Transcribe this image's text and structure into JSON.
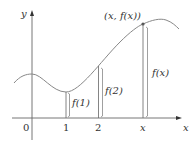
{
  "axes": {
    "x_label": "x",
    "y_label": "y",
    "origin_label": "0",
    "ticks": [
      "1",
      "2",
      "x"
    ]
  },
  "point": {
    "label": "(x, f(x))"
  },
  "heights": [
    {
      "label": "f(1)"
    },
    {
      "label": "f(2)"
    },
    {
      "label": "f(x)"
    }
  ],
  "colors": {
    "curve": "#888888",
    "axes": "#666666",
    "text": "#333333"
  }
}
